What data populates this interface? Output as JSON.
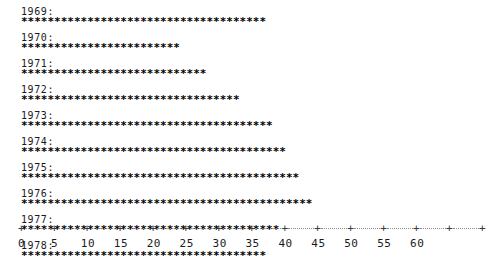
{
  "chart_data": {
    "type": "bar",
    "title": "",
    "subtitle": "",
    "xlabel": "",
    "ylabel": "",
    "orientation": "horizontal",
    "render_style": "ascii-asterisk",
    "marker": "*",
    "units_per_marker": 1,
    "grid": false,
    "legend": null,
    "xlim": [
      0,
      65
    ],
    "categories": [
      "1969",
      "1970",
      "1971",
      "1972",
      "1973",
      "1974",
      "1975",
      "1976",
      "1977",
      "1978"
    ],
    "values": [
      37,
      24,
      28,
      33,
      38,
      40,
      42,
      44,
      39,
      37
    ],
    "rows": [
      {
        "label": "1969:",
        "value": 37,
        "bar": "*************************************"
      },
      {
        "label": "1970:",
        "value": 24,
        "bar": "************************"
      },
      {
        "label": "1971:",
        "value": 28,
        "bar": "****************************"
      },
      {
        "label": "1972:",
        "value": 33,
        "bar": "*********************************"
      },
      {
        "label": "1973:",
        "value": 38,
        "bar": "**************************************"
      },
      {
        "label": "1974:",
        "value": 40,
        "bar": "****************************************"
      },
      {
        "label": "1975:",
        "value": 42,
        "bar": "******************************************"
      },
      {
        "label": "1976:",
        "value": 44,
        "bar": "********************************************"
      },
      {
        "label": "1977:",
        "value": 39,
        "bar": "***************************************"
      },
      {
        "label": "1978:",
        "value": 37,
        "bar": "*************************************"
      }
    ],
    "axis": {
      "tick_marker": "+",
      "tick_step": 5,
      "ticks": [
        {
          "value": 0,
          "label": "0"
        },
        {
          "value": 5,
          "label": "5"
        },
        {
          "value": 10,
          "label": "10"
        },
        {
          "value": 15,
          "label": "15"
        },
        {
          "value": 20,
          "label": "20"
        },
        {
          "value": 25,
          "label": "25"
        },
        {
          "value": 30,
          "label": "30"
        },
        {
          "value": 35,
          "label": "35"
        },
        {
          "value": 40,
          "label": "40"
        },
        {
          "value": 45,
          "label": "45"
        },
        {
          "value": 50,
          "label": "50"
        },
        {
          "value": 55,
          "label": "55"
        },
        {
          "value": 60,
          "label": "60"
        },
        {
          "value": 65,
          "label": ""
        },
        {
          "value": 70,
          "label": ""
        }
      ]
    }
  },
  "colors": {
    "background": "#ffffff",
    "bar": "#000000",
    "label": "#1a1a1a",
    "axis": "#3a3a3a",
    "axis_rule": "#8a8a8a"
  }
}
